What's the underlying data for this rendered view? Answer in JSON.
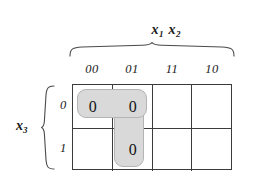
{
  "figure": {
    "type": "karnaugh-map",
    "variables_top": {
      "text": "x1 x2",
      "var1": "x",
      "sub1": "1",
      "var2": "x",
      "sub2": "2"
    },
    "variables_left": {
      "text": "x3",
      "var": "x",
      "sub": "3"
    },
    "column_labels": [
      "00",
      "01",
      "11",
      "10"
    ],
    "row_labels": [
      "0",
      "1"
    ],
    "cells": [
      [
        "0",
        "0",
        "",
        ""
      ],
      [
        "",
        "0",
        "",
        ""
      ]
    ],
    "groups": [
      {
        "name": "horizontal-pair-row0-cols00-01",
        "row": 0,
        "col_start": 0,
        "col_span": 2,
        "row_span": 1
      },
      {
        "name": "vertical-pair-col01-rows0-1",
        "row": 0,
        "col_start": 1,
        "col_span": 1,
        "row_span": 2
      }
    ],
    "colors": {
      "grid_line": "#3b3b3b",
      "group_fill": "#d9d9d9",
      "group_border": "#b4b4b4",
      "text": "#111111",
      "background": "#ffffff"
    }
  }
}
